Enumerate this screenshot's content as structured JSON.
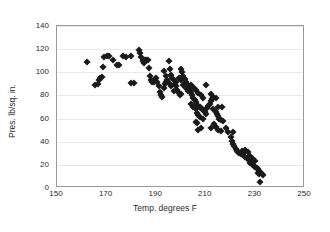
{
  "chart_data": {
    "type": "scatter",
    "title": "",
    "xlabel": "Temp. degrees F",
    "ylabel": "Pres. lb/sq. in.",
    "xlim": [
      150,
      250
    ],
    "ylim": [
      0,
      140
    ],
    "xticks": [
      150,
      170,
      190,
      210,
      230,
      250
    ],
    "yticks": [
      0,
      20,
      40,
      60,
      80,
      100,
      120,
      140
    ],
    "grid": "horizontal",
    "legend": "none",
    "marker": "diamond",
    "marker_color": "#1a1a1a",
    "points": [
      [
        162.0,
        109.0
      ],
      [
        165.5,
        89.0
      ],
      [
        166.5,
        89.5
      ],
      [
        167.0,
        93.0
      ],
      [
        167.5,
        95.0
      ],
      [
        168.0,
        96.0
      ],
      [
        168.5,
        105.0
      ],
      [
        169.0,
        113.0
      ],
      [
        170.0,
        114.0
      ],
      [
        171.0,
        114.5
      ],
      [
        172.5,
        111.0
      ],
      [
        174.0,
        106.0
      ],
      [
        175.0,
        106.0
      ],
      [
        176.5,
        114.0
      ],
      [
        178.0,
        113.5
      ],
      [
        180.0,
        114.5
      ],
      [
        180.0,
        91.0
      ],
      [
        181.0,
        91.0
      ],
      [
        183.0,
        119.5
      ],
      [
        183.5,
        117.0
      ],
      [
        184.0,
        113.0
      ],
      [
        184.5,
        110.0
      ],
      [
        185.0,
        108.0
      ],
      [
        185.5,
        111.0
      ],
      [
        186.0,
        111.0
      ],
      [
        186.5,
        110.5
      ],
      [
        187.0,
        104.0
      ],
      [
        187.5,
        97.0
      ],
      [
        188.0,
        93.0
      ],
      [
        188.5,
        92.0
      ],
      [
        189.0,
        91.5
      ],
      [
        189.5,
        94.0
      ],
      [
        190.0,
        95.0
      ],
      [
        190.5,
        92.0
      ],
      [
        191.0,
        88.0
      ],
      [
        191.5,
        83.0
      ],
      [
        192.0,
        80.0
      ],
      [
        192.5,
        79.0
      ],
      [
        193.0,
        86.0
      ],
      [
        193.5,
        90.0
      ],
      [
        194.0,
        92.0
      ],
      [
        194.5,
        93.0
      ],
      [
        195.0,
        91.0
      ],
      [
        195.0,
        110.0
      ],
      [
        195.5,
        103.0
      ],
      [
        196.0,
        98.0
      ],
      [
        196.5,
        95.0
      ],
      [
        197.0,
        93.0
      ],
      [
        197.5,
        90.0
      ],
      [
        198.0,
        88.0
      ],
      [
        198.5,
        85.0
      ],
      [
        199.0,
        82.0
      ],
      [
        199.5,
        80.0
      ],
      [
        200.0,
        81.0
      ],
      [
        200.0,
        103.0
      ],
      [
        200.5,
        100.0
      ],
      [
        201.0,
        97.0
      ],
      [
        201.5,
        94.0
      ],
      [
        202.0,
        92.0
      ],
      [
        202.5,
        90.0
      ],
      [
        203.0,
        88.0
      ],
      [
        203.5,
        86.0
      ],
      [
        204.0,
        83.0
      ],
      [
        204.5,
        80.0
      ],
      [
        205.0,
        78.0
      ],
      [
        205.5,
        76.0
      ],
      [
        206.0,
        74.0
      ],
      [
        206.5,
        72.0
      ],
      [
        207.0,
        71.0
      ],
      [
        207.5,
        70.0
      ],
      [
        208.0,
        69.0
      ],
      [
        208.5,
        68.0
      ],
      [
        209.0,
        67.0
      ],
      [
        209.5,
        66.0
      ],
      [
        193.0,
        101.0
      ],
      [
        194.0,
        97.0
      ],
      [
        196.0,
        88.0
      ],
      [
        197.0,
        84.0
      ],
      [
        198.0,
        92.0
      ],
      [
        199.0,
        95.0
      ],
      [
        200.0,
        93.0
      ],
      [
        201.0,
        89.0
      ],
      [
        202.0,
        86.0
      ],
      [
        203.0,
        84.0
      ],
      [
        204.0,
        89.0
      ],
      [
        205.0,
        87.0
      ],
      [
        206.0,
        85.0
      ],
      [
        207.0,
        82.0
      ],
      [
        208.0,
        80.0
      ],
      [
        209.0,
        78.0
      ],
      [
        204.0,
        73.0
      ],
      [
        205.0,
        70.0
      ],
      [
        206.0,
        68.0
      ],
      [
        206.5,
        65.0
      ],
      [
        207.0,
        63.0
      ],
      [
        207.5,
        61.0
      ],
      [
        206.0,
        57.0
      ],
      [
        206.5,
        56.0
      ],
      [
        207.0,
        50.0
      ],
      [
        208.0,
        52.0
      ],
      [
        209.0,
        60.0
      ],
      [
        210.0,
        64.0
      ],
      [
        210.5,
        69.0
      ],
      [
        211.0,
        71.0
      ],
      [
        211.5,
        73.0
      ],
      [
        212.0,
        75.0
      ],
      [
        212.5,
        77.0
      ],
      [
        210.0,
        89.0
      ],
      [
        212.0,
        81.0
      ],
      [
        213.0,
        79.0
      ],
      [
        214.0,
        78.0
      ],
      [
        213.0,
        68.0
      ],
      [
        214.0,
        66.0
      ],
      [
        214.5,
        64.0
      ],
      [
        215.0,
        62.0
      ],
      [
        215.5,
        60.0
      ],
      [
        216.0,
        59.0
      ],
      [
        213.5,
        55.0
      ],
      [
        214.0,
        53.0
      ],
      [
        212.0,
        52.0
      ],
      [
        215.0,
        50.0
      ],
      [
        216.0,
        49.0
      ],
      [
        215.0,
        70.0
      ],
      [
        216.5,
        70.0
      ],
      [
        217.0,
        58.0
      ],
      [
        218.0,
        52.0
      ],
      [
        219.0,
        48.0
      ],
      [
        220.0,
        44.0
      ],
      [
        220.5,
        41.0
      ],
      [
        221.0,
        38.0
      ],
      [
        221.5,
        36.0
      ],
      [
        222.0,
        34.0
      ],
      [
        222.5,
        32.0
      ],
      [
        223.0,
        31.0
      ],
      [
        223.5,
        30.0
      ],
      [
        224.0,
        29.0
      ],
      [
        221.0,
        48.0
      ],
      [
        224.5,
        32.0
      ],
      [
        225.0,
        30.0
      ],
      [
        225.5,
        28.0
      ],
      [
        226.0,
        27.0
      ],
      [
        226.5,
        26.0
      ],
      [
        227.0,
        25.0
      ],
      [
        227.5,
        24.0
      ],
      [
        228.0,
        22.0
      ],
      [
        228.5,
        21.0
      ],
      [
        229.0,
        20.0
      ],
      [
        229.5,
        19.0
      ],
      [
        230.0,
        18.0
      ],
      [
        230.5,
        17.0
      ],
      [
        231.0,
        16.0
      ],
      [
        231.5,
        15.0
      ],
      [
        231.0,
        13.0
      ],
      [
        231.5,
        12.0
      ],
      [
        232.0,
        14.0
      ],
      [
        232.5,
        12.0
      ],
      [
        233.0,
        11.0
      ],
      [
        232.0,
        5.0
      ],
      [
        230.0,
        23.0
      ],
      [
        229.0,
        25.0
      ],
      [
        228.0,
        28.0
      ],
      [
        227.0,
        31.0
      ],
      [
        226.0,
        33.0
      ]
    ]
  }
}
